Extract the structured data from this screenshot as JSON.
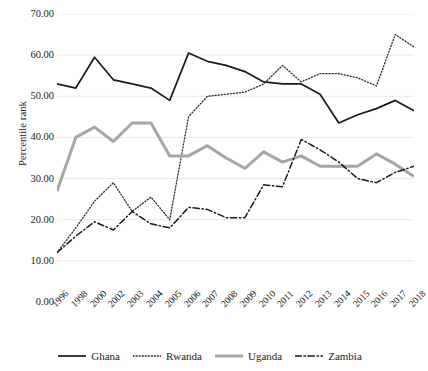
{
  "chart_data": {
    "type": "line",
    "title": "",
    "xlabel": "",
    "ylabel": "Percentile rank",
    "ylim": [
      0,
      70
    ],
    "ytick_labels": [
      "0.00",
      "10.00",
      "20.00",
      "30.00",
      "40.00",
      "50.00",
      "60.00",
      "70.00"
    ],
    "yticks": [
      0,
      10,
      20,
      30,
      40,
      50,
      60,
      70
    ],
    "grid": true,
    "grid_axis": "y",
    "legend_position": "bottom",
    "categories": [
      "1996",
      "1998",
      "2000",
      "2002",
      "2003",
      "2004",
      "2005",
      "2006",
      "2007",
      "2008",
      "2009",
      "2010",
      "2011",
      "2012",
      "2013",
      "2014",
      "2015",
      "2016",
      "2017",
      "2018"
    ],
    "series": [
      {
        "name": "Ghana",
        "style": "solid",
        "color": "#1a1a1a",
        "width": 1.7,
        "values": [
          53.0,
          52.0,
          59.5,
          54.0,
          53.0,
          52.0,
          49.0,
          60.5,
          58.5,
          57.5,
          56.0,
          53.5,
          53.0,
          53.0,
          50.5,
          43.5,
          45.5,
          47.0,
          49.0,
          46.5
        ]
      },
      {
        "name": "Rwanda",
        "style": "dotted",
        "color": "#2b2b2b",
        "width": 1.3,
        "values": [
          12.0,
          18.0,
          24.5,
          29.0,
          22.0,
          25.5,
          20.0,
          45.0,
          50.0,
          50.5,
          51.0,
          53.0,
          57.5,
          53.5,
          55.5,
          55.5,
          54.5,
          52.5,
          65.0,
          62.0
        ]
      },
      {
        "name": "Uganda",
        "style": "solid",
        "color": "#a6a6a6",
        "width": 3.0,
        "values": [
          27.0,
          40.0,
          42.5,
          39.0,
          43.5,
          43.5,
          35.5,
          35.5,
          38.0,
          35.0,
          32.5,
          36.5,
          34.0,
          35.5,
          33.0,
          33.0,
          33.0,
          36.0,
          33.5,
          30.5
        ]
      },
      {
        "name": "Zambia",
        "style": "dashdot",
        "color": "#1a1a1a",
        "width": 1.5,
        "values": [
          12.0,
          16.0,
          19.5,
          17.5,
          22.0,
          19.0,
          18.0,
          23.0,
          22.5,
          20.5,
          20.5,
          28.5,
          28.0,
          39.5,
          37.0,
          34.0,
          30.0,
          29.0,
          31.5,
          33.0
        ]
      }
    ]
  },
  "legend": {
    "items": [
      {
        "label": "Ghana"
      },
      {
        "label": "Rwanda"
      },
      {
        "label": "Uganda"
      },
      {
        "label": "Zambia"
      }
    ]
  }
}
